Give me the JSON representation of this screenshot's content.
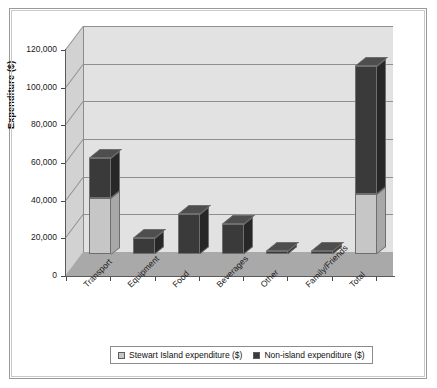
{
  "chart_data": {
    "type": "bar",
    "title": "",
    "subtitle": "",
    "xlabel": "",
    "ylabel": "Expenditure ($)",
    "ylim": [
      0,
      120000
    ],
    "ytick_labels": [
      "120,000",
      "100,000",
      "80,000",
      "60,000",
      "40,000",
      "20,000",
      "0"
    ],
    "ytick_values": [
      120000,
      100000,
      80000,
      60000,
      40000,
      20000,
      0
    ],
    "grid": true,
    "stacked": true,
    "three_d": true,
    "legend_position": "bottom",
    "categories": [
      "Transport",
      "Equipment",
      "Food",
      "Beverages",
      "Other",
      "Family/Friends",
      "Total"
    ],
    "series": [
      {
        "name": "Stewart Island expenditure ($)",
        "color": "#c6c6c6",
        "values": [
          30000,
          0,
          0,
          0,
          0,
          0,
          32000
        ]
      },
      {
        "name": "Non-island expenditure ($)",
        "color": "#3a3a3a",
        "values": [
          21000,
          8500,
          21000,
          16000,
          1200,
          500,
          68000
        ]
      }
    ],
    "totals": [
      51000,
      8500,
      21000,
      16000,
      1200,
      500,
      100000
    ]
  },
  "legend": {
    "entries": [
      {
        "label": "Stewart Island expenditure ($)",
        "swatch": "light-swatch-icon"
      },
      {
        "label": "Non-island expenditure ($)",
        "swatch": "dark-swatch-icon"
      }
    ]
  },
  "axes": {
    "y_title": "Expenditure ($)"
  }
}
